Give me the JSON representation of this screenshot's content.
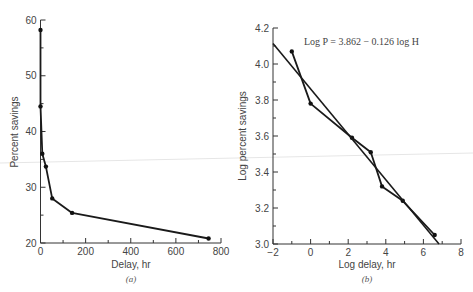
{
  "chart_data": [
    {
      "id": "a",
      "type": "line",
      "title": "",
      "caption": "(a)",
      "xlabel": "Delay, hr",
      "ylabel": "Percent savings",
      "xlim": [
        0,
        800
      ],
      "ylim": [
        20,
        60
      ],
      "xticks": [
        0,
        200,
        400,
        600,
        800
      ],
      "yticks": [
        20,
        30,
        40,
        50,
        60
      ],
      "grid": false,
      "legend": null,
      "series": [
        {
          "name": "Percent savings vs delay",
          "x": [
            0,
            0,
            8,
            24,
            52,
            140,
            745
          ],
          "y": [
            58.2,
            44.5,
            36.0,
            33.7,
            28.0,
            25.4,
            20.8
          ]
        }
      ]
    },
    {
      "id": "b",
      "type": "line",
      "title": "",
      "caption": "(b)",
      "xlabel": "Log delay, hr",
      "ylabel": "Log percent savings",
      "xlim": [
        -2,
        8
      ],
      "ylim": [
        3.0,
        4.2
      ],
      "xticks": [
        -2,
        0,
        2,
        4,
        6,
        8
      ],
      "yticks": [
        3.0,
        3.2,
        3.4,
        3.6,
        3.8,
        4.0,
        4.2
      ],
      "grid": false,
      "legend": null,
      "annotations": [
        {
          "text": "Log P = 3.862 − 0.126 log H",
          "x": 0.4,
          "y": 4.15
        }
      ],
      "series": [
        {
          "name": "Observed",
          "x": [
            -1.0,
            0.0,
            2.2,
            3.2,
            3.8,
            4.9,
            6.6
          ],
          "y": [
            4.07,
            3.78,
            3.59,
            3.51,
            3.32,
            3.24,
            3.05
          ]
        },
        {
          "name": "Fitted: Log P = 3.862 - 0.126 log H",
          "x": [
            -2.0,
            6.83
          ],
          "y": [
            4.114,
            3.0
          ]
        }
      ]
    }
  ],
  "labels": {
    "a": {
      "xlabel": "Delay, hr",
      "ylabel": "Percent savings",
      "caption": "(a)",
      "xticks": [
        "0",
        "200",
        "400",
        "600",
        "800"
      ],
      "yticks": [
        "20",
        "30",
        "40",
        "50",
        "60"
      ]
    },
    "b": {
      "xlabel": "Log delay, hr",
      "ylabel": "Log percent savings",
      "caption": "(b)",
      "equation": "Log P = 3.862 − 0.126 log H",
      "xticks": [
        "−2",
        "0",
        "2",
        "4",
        "6",
        "8"
      ],
      "yticks": [
        "3.0",
        "3.2",
        "3.4",
        "3.6",
        "3.8",
        "4.0",
        "4.2"
      ]
    }
  }
}
